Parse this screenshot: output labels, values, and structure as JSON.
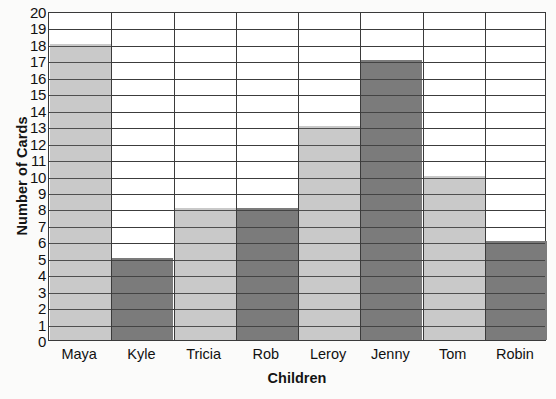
{
  "chart_data": {
    "type": "bar",
    "title": "",
    "xlabel": "Children",
    "ylabel": "Number of Cards",
    "categories": [
      "Maya",
      "Kyle",
      "Tricia",
      "Rob",
      "Leroy",
      "Jenny",
      "Tom",
      "Robin"
    ],
    "values": [
      18,
      5,
      8,
      8,
      13,
      17,
      10,
      6
    ],
    "bar_colors": [
      "#c9c9c9",
      "#7b7b7b",
      "#c9c9c9",
      "#7b7b7b",
      "#c9c9c9",
      "#7b7b7b",
      "#c9c9c9",
      "#7b7b7b"
    ],
    "ylim": [
      0,
      20
    ],
    "ytick_step": 1,
    "ytick_labels": [
      "20",
      "19",
      "18",
      "17",
      "16",
      "15",
      "14",
      "13",
      "12",
      "11",
      "10",
      "9",
      "8",
      "7",
      "6",
      "5",
      "4",
      "3",
      "2",
      "1",
      "0"
    ],
    "grid": true,
    "grid_orientation": "both",
    "legend": null,
    "axis_color": "#3a3a3a",
    "gridline_color": "#4a4a4a",
    "plot_background": "#ffffff"
  },
  "labels": {
    "y_axis_title": "Number of Cards",
    "x_axis_title": "Children"
  }
}
